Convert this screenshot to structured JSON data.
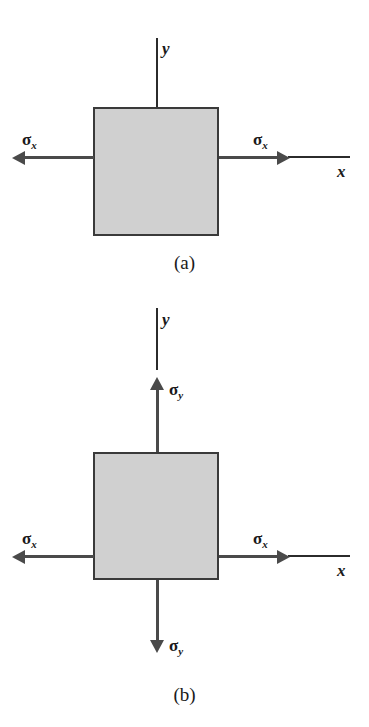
{
  "figure": {
    "type": "stress-element-diagram"
  },
  "panels": [
    {
      "id": "a",
      "caption": "(a)",
      "axes": {
        "x_label": "x",
        "y_label": "y",
        "origin_label": "O"
      },
      "stresses": [
        {
          "name": "sigma-x-left",
          "symbol": "σ",
          "subscript": "x",
          "direction": "left"
        },
        {
          "name": "sigma-x-right",
          "symbol": "σ",
          "subscript": "x",
          "direction": "right"
        }
      ]
    },
    {
      "id": "b",
      "caption": "(b)",
      "axes": {
        "x_label": "x",
        "y_label": "y",
        "origin_label": "O"
      },
      "stresses": [
        {
          "name": "sigma-x-left",
          "symbol": "σ",
          "subscript": "x",
          "direction": "left"
        },
        {
          "name": "sigma-x-right",
          "symbol": "σ",
          "subscript": "x",
          "direction": "right"
        },
        {
          "name": "sigma-y-top",
          "symbol": "σ",
          "subscript": "y",
          "direction": "up"
        },
        {
          "name": "sigma-y-bottom",
          "symbol": "σ",
          "subscript": "y",
          "direction": "down"
        }
      ]
    }
  ],
  "colors": {
    "element_fill": "#d0d0d0",
    "element_border": "#3a3a3a",
    "arrow": "#4a4a4a",
    "axis": "#2b2b2b",
    "background": "#ffffff"
  }
}
